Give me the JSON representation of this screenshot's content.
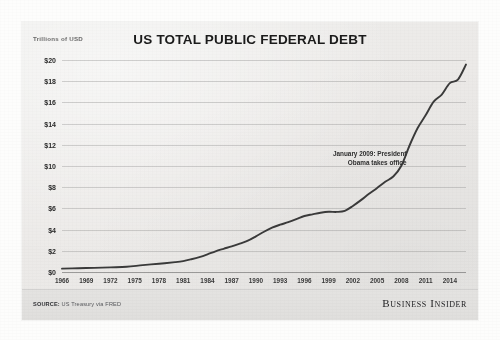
{
  "chart_data": {
    "type": "line",
    "title": "US TOTAL PUBLIC FEDERAL DEBT",
    "ylabel": "Trillions of USD",
    "xlabel": "",
    "ylim": [
      0,
      20
    ],
    "xlim": [
      1966,
      2016
    ],
    "grid": true,
    "legend": "none",
    "yticks": [
      "$0",
      "$2",
      "$4",
      "$6",
      "$8",
      "$10",
      "$12",
      "$14",
      "$16",
      "$18",
      "$20"
    ],
    "ytick_values": [
      0,
      2,
      4,
      6,
      8,
      10,
      12,
      14,
      16,
      18,
      20
    ],
    "xticks": [
      "1966",
      "1969",
      "1972",
      "1975",
      "1978",
      "1981",
      "1984",
      "1987",
      "1990",
      "1993",
      "1996",
      "1999",
      "2002",
      "2005",
      "2008",
      "2011",
      "2014"
    ],
    "xtick_values": [
      1966,
      1969,
      1972,
      1975,
      1978,
      1981,
      1984,
      1987,
      1990,
      1993,
      1996,
      1999,
      2002,
      2005,
      2008,
      2011,
      2014
    ],
    "series": [
      {
        "name": "Total Public Federal Debt",
        "color": "#3a3a3a",
        "x": [
          1966,
          1968,
          1970,
          1972,
          1974,
          1976,
          1978,
          1980,
          1981,
          1982,
          1983,
          1984,
          1985,
          1986,
          1987,
          1988,
          1989,
          1990,
          1991,
          1992,
          1993,
          1994,
          1995,
          1996,
          1997,
          1998,
          1999,
          2000,
          2001,
          2002,
          2003,
          2004,
          2005,
          2006,
          2007,
          2008,
          2009,
          2010,
          2011,
          2012,
          2013,
          2014,
          2015,
          2016
        ],
        "values": [
          0.32,
          0.36,
          0.39,
          0.44,
          0.49,
          0.65,
          0.78,
          0.93,
          1.03,
          1.2,
          1.4,
          1.66,
          1.95,
          2.19,
          2.42,
          2.68,
          2.95,
          3.36,
          3.8,
          4.18,
          4.46,
          4.7,
          4.98,
          5.28,
          5.44,
          5.59,
          5.68,
          5.67,
          5.77,
          6.23,
          6.78,
          7.38,
          7.93,
          8.51,
          9.01,
          10.02,
          11.91,
          13.56,
          14.79,
          16.07,
          16.74,
          17.82,
          18.15,
          19.57
        ]
      }
    ],
    "annotations": [
      {
        "text_line1": "January 2009: President",
        "text_line2": "Obama takes office",
        "x": 2009,
        "y": 10.6
      }
    ]
  },
  "footer": {
    "source_label": "SOURCE:",
    "source_value": "US Treasury via FRED",
    "brand": "Business Insider"
  }
}
